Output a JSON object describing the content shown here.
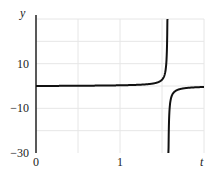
{
  "chart_data": {
    "type": "line",
    "title": "",
    "xlabel": "t",
    "ylabel": "y",
    "xlim": [
      0,
      2
    ],
    "ylim": [
      -30,
      30
    ],
    "x_ticks": [
      {
        "value": 0,
        "label": "0"
      },
      {
        "value": 1,
        "label": "1"
      }
    ],
    "y_ticks": [
      {
        "value": 10,
        "label": "10"
      },
      {
        "value": -10,
        "label": "-10"
      },
      {
        "value": -30,
        "label": "-30"
      }
    ],
    "grid": true,
    "grid_x": [
      0.5,
      1,
      1.5,
      2
    ],
    "grid_y": [
      -20,
      -10,
      0,
      10,
      20,
      30
    ],
    "legend": null,
    "series": [
      {
        "name": "y(t)",
        "description": "tangent-like curve ≈ 0 on [0, π/2), vertical asymptote at t≈1.57, slightly negative after",
        "asymptote_t": 1.5708,
        "x": [
          0,
          0.5,
          1.0,
          1.4,
          1.5,
          1.55,
          1.565,
          1.575,
          1.59,
          1.65,
          1.8,
          2.0
        ],
        "values": [
          0,
          0.11,
          0.31,
          1.16,
          2.82,
          10.4,
          34,
          -32,
          -10.4,
          -2.52,
          -0.93,
          -0.44
        ]
      }
    ],
    "colors": {
      "line": "#111111",
      "grid": "#e6e6e6",
      "axis": "#222222"
    }
  }
}
